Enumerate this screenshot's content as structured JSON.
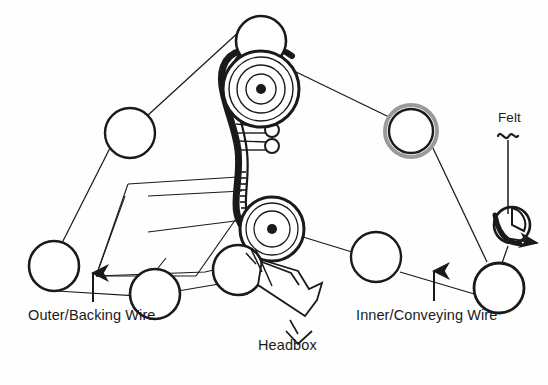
{
  "figure": {
    "type": "twin-wire-former-schematic",
    "background_color": "#fefefe",
    "line_color": "#1a1a1a",
    "width": 548,
    "height": 385
  },
  "labels": {
    "outer_wire": "Outer/Backing Wire",
    "inner_wire": "Inner/Conveying Wire",
    "headbox": "Headbox",
    "felt": "Felt"
  },
  "annotations": [
    {
      "name": "outer-wire-arrow",
      "glyph": "arrow-up",
      "points_to": "outer-backing-wire-path"
    },
    {
      "name": "inner-wire-arrow",
      "glyph": "arrow-up",
      "points_to": "inner-conveying-wire-path"
    },
    {
      "name": "headbox-pointer",
      "glyph": "chevron-down",
      "points_to": "headbox-nozzle"
    },
    {
      "name": "felt-pointer",
      "glyph": "wavy-line-with-stem",
      "points_to": "felt-roll"
    },
    {
      "name": "felt-run-arrow",
      "glyph": "arrow-right",
      "points_to": "felt-roll"
    }
  ],
  "components": {
    "rolls": [
      {
        "name": "top-guide-roll",
        "cx": 261,
        "cy": 41,
        "r": 25,
        "style": "plain"
      },
      {
        "name": "forming-roll-upper",
        "cx": 261,
        "cy": 89,
        "r": 38,
        "style": "concentric-hub"
      },
      {
        "name": "forming-roll-lower",
        "cx": 272,
        "cy": 229,
        "r": 32,
        "style": "concentric-hub"
      },
      {
        "name": "upper-left-guide-roll",
        "cx": 130,
        "cy": 133,
        "r": 25,
        "style": "plain"
      },
      {
        "name": "lower-left-guide-roll",
        "cx": 54,
        "cy": 266,
        "r": 25,
        "style": "plain"
      },
      {
        "name": "bottom-left-guide-roll",
        "cx": 155,
        "cy": 283,
        "r": 25,
        "style": "plain"
      },
      {
        "name": "breast-roll",
        "cx": 238,
        "cy": 270,
        "r": 25,
        "style": "plain"
      },
      {
        "name": "upper-right-guide-roll",
        "cx": 411,
        "cy": 131,
        "r": 26,
        "style": "ringed"
      },
      {
        "name": "lower-right-guide-roll",
        "cx": 376,
        "cy": 257,
        "r": 25,
        "style": "plain"
      },
      {
        "name": "couch-roll",
        "cx": 499,
        "cy": 284,
        "r": 25,
        "style": "plain"
      },
      {
        "name": "felt-roll",
        "cx": 510,
        "cy": 226,
        "r": 18,
        "style": "wedge-cut"
      },
      {
        "name": "shower-roll-upper",
        "cx": 272,
        "cy": 133,
        "r": 7,
        "style": "small"
      },
      {
        "name": "shower-roll-lower",
        "cx": 272,
        "cy": 148,
        "r": 7,
        "style": "small"
      }
    ],
    "wires": [
      {
        "name": "outer-backing-wire-path",
        "weight": "thin"
      },
      {
        "name": "inner-conveying-wire-path",
        "weight": "thin"
      },
      {
        "name": "forming-nip-wire",
        "weight": "thick"
      }
    ],
    "other": [
      {
        "name": "headbox-nozzle",
        "shape": "angled-polygon"
      },
      {
        "name": "suction-box-frame",
        "shape": "parallelogram-frame"
      },
      {
        "name": "dewatering-hatching",
        "shape": "dashed-ticks"
      },
      {
        "name": "shower-pipes",
        "shape": "parallel-lines"
      }
    ]
  }
}
